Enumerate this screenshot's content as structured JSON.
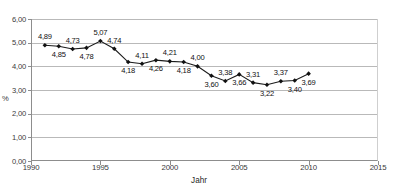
{
  "title_cut": "",
  "axes": {
    "yaxis_label": "%",
    "xaxis_label": "Jahr",
    "yticks": [
      "0,00",
      "1,00",
      "2,00",
      "3,00",
      "4,00",
      "5,00",
      "6,00"
    ],
    "xticks": [
      "1990",
      "1995",
      "2000",
      "2005",
      "2010",
      "2015"
    ]
  },
  "chart_data": {
    "type": "line",
    "title": "",
    "xlabel": "Jahr",
    "ylabel": "%",
    "xlim": [
      1990,
      2015
    ],
    "ylim": [
      0,
      6
    ],
    "ytick_values": [
      0,
      1,
      2,
      3,
      4,
      5,
      6
    ],
    "ytick_labels": [
      "0,00",
      "1,00",
      "2,00",
      "3,00",
      "4,00",
      "5,00",
      "6,00"
    ],
    "xtick_values": [
      1990,
      1995,
      2000,
      2005,
      2010,
      2015
    ],
    "xtick_labels": [
      "1990",
      "1995",
      "2000",
      "2005",
      "2010",
      "2015"
    ],
    "grid": "horizontal",
    "legend": "none",
    "marker": "diamond",
    "series": [
      {
        "name": "Anteil",
        "x": [
          1991,
          1992,
          1993,
          1994,
          1995,
          1996,
          1997,
          1998,
          1999,
          2000,
          2001,
          2002,
          2003,
          2004,
          2005,
          2006,
          2007,
          2008,
          2009,
          2010
        ],
        "values": [
          4.89,
          4.85,
          4.73,
          4.78,
          5.07,
          4.74,
          4.18,
          4.11,
          4.26,
          4.21,
          4.18,
          4.0,
          3.6,
          3.38,
          3.66,
          3.31,
          3.22,
          3.37,
          3.4,
          3.69
        ],
        "labels": [
          "4,89",
          "4,85",
          "4,73",
          "4,78",
          "5,07",
          "4,74",
          "4,18",
          "4,11",
          "4,26",
          "4,21",
          "4,18",
          "4,00",
          "3,60",
          "3,38",
          "3,66",
          "3,31",
          "3,22",
          "3,37",
          "3,40",
          "3,69"
        ],
        "label_positions": [
          "above",
          "below",
          "above",
          "below",
          "above",
          "above",
          "below",
          "above",
          "below",
          "above",
          "below",
          "above",
          "below",
          "above",
          "below",
          "above",
          "below",
          "above",
          "below",
          "below"
        ]
      }
    ]
  }
}
